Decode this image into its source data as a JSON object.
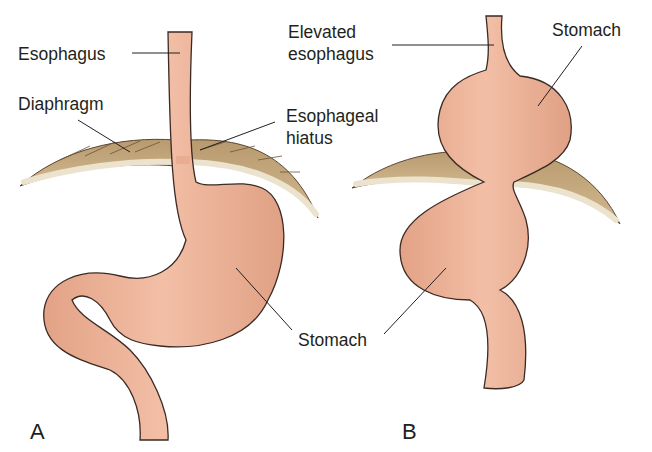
{
  "figure": {
    "panels": [
      {
        "id": "A",
        "letter": "A",
        "labels": {
          "esophagus": "Esophagus",
          "diaphragm": "Diaphragm",
          "hiatus_line1": "Esophageal",
          "hiatus_line2": "hiatus",
          "stomach": "Stomach"
        }
      },
      {
        "id": "B",
        "letter": "B",
        "labels": {
          "elevated_line1": "Elevated",
          "elevated_line2": "esophagus",
          "stomach": "Stomach"
        }
      }
    ],
    "colors": {
      "tissue": "#eeb49a",
      "tissue_shadow": "#d98f74",
      "outline": "#3a2a25",
      "diaphragm": "#c9ab82",
      "diaphragm_edge": "#ece3cf",
      "text": "#231f20"
    }
  }
}
